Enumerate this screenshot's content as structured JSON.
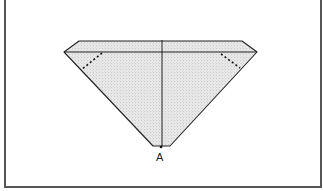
{
  "figure": {
    "labels": {
      "point_a": "A"
    },
    "colors": {
      "border": "#555555",
      "outline": "#222222",
      "fill": "#d9d9d9",
      "stipple": "#9a9a9a",
      "dots": "#111111"
    }
  }
}
